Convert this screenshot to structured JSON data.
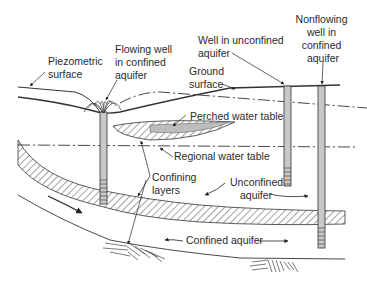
{
  "diagram": {
    "type": "groundwater-aquifer-cross-section",
    "colors": {
      "line": "#333333",
      "well_fill": "#c8c8c8",
      "perched_fill": "#bdbdbd",
      "background": "#ffffff"
    },
    "labels": {
      "piezometric_surface": [
        "Piezometric",
        "surface"
      ],
      "flowing_well": [
        "Flowing well",
        "in confined",
        "aquifer"
      ],
      "ground_surface": [
        "Ground",
        "surface"
      ],
      "well_unconfined": [
        "Well in unconfined",
        "aquifer"
      ],
      "nonflowing_well": [
        "Nonflowing",
        "well in",
        "confined",
        "aquifer"
      ],
      "perched_water_table": "Perched water table",
      "regional_water_table": "Regional water table",
      "confining_layers": [
        "Confining",
        "layers"
      ],
      "unconfined_aquifer": [
        "Unconfined",
        "aquifer"
      ],
      "confined_aquifer": "Confined aquifer"
    }
  }
}
